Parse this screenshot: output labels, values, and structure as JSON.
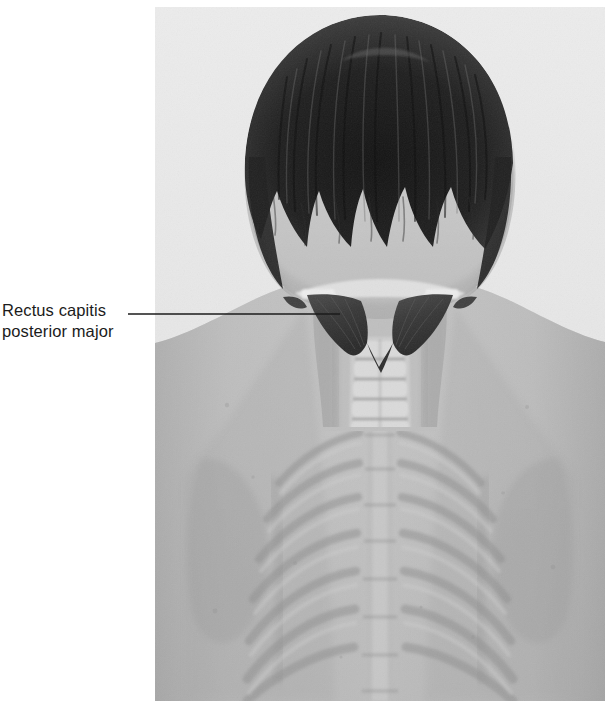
{
  "figure": {
    "kind": "anatomy-photo-overlay",
    "region": "posterior neck and upper back",
    "view": "posterior"
  },
  "annotation": {
    "label_line_1": "Rectus capitis",
    "label_line_2": "posterior major",
    "leader_line": {
      "from_x": 128,
      "to_x": 340,
      "y": 314
    }
  },
  "palette": {
    "page_background": "#ffffff",
    "panel_background": "#e8e8e8",
    "text_color": "#1b1b1b",
    "leader_color": "#1b1b1b",
    "hair_dark": "#262626",
    "hair_mid": "#4a4a4a",
    "skin_light": "#c9c9c9",
    "skin_mid": "#b2b2b2",
    "skin_shadow": "#9a9a9a",
    "muscle_highlight": "#3b3b3b",
    "bone_light": "#d8d8d8",
    "bone_mid": "#c2c2c2",
    "rib_shadow": "#8f8f8f"
  },
  "photo_panel": {
    "left": 155,
    "top": 7,
    "width": 450,
    "height": 694
  },
  "structures": [
    {
      "name": "hair",
      "note": "dark hair covering occiput"
    },
    {
      "name": "occipital-bone",
      "note": "pale bone band at skull base"
    },
    {
      "name": "rectus-capitis-posterior-major-left",
      "note": "dark triangular muscle"
    },
    {
      "name": "rectus-capitis-posterior-major-right",
      "note": "dark triangular muscle"
    },
    {
      "name": "cervical-vertebrae",
      "note": "stacked cervical spinous processes"
    },
    {
      "name": "thoracic-vertebrae",
      "note": "midline thoracic spine"
    },
    {
      "name": "ribs",
      "note": "ghosted posterior ribs radiating laterally"
    },
    {
      "name": "scapula-left",
      "note": "shoulder blade outline"
    },
    {
      "name": "scapula-right",
      "note": "shoulder blade outline"
    },
    {
      "name": "shoulder-left",
      "note": "sloping shoulder contour"
    },
    {
      "name": "shoulder-right",
      "note": "sloping shoulder contour"
    }
  ]
}
